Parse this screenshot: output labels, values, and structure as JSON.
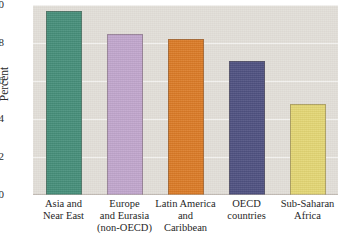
{
  "chart_data": {
    "type": "bar",
    "title": "",
    "xlabel": "",
    "ylabel": "Percent",
    "ylim": [
      0,
      10
    ],
    "yticks": [
      0,
      2,
      4,
      6,
      8,
      10
    ],
    "ytick_labels": [
      "0",
      "2",
      "4",
      "6",
      "8",
      "10"
    ],
    "grid": true,
    "legend": "none",
    "categories": [
      "Asia and Near East",
      "Europe and Eurasia (non-OECD)",
      "Latin America and Caribbean",
      "OECD countries",
      "Sub-Saharan Africa"
    ],
    "category_lines": [
      [
        "Asia and",
        "Near East"
      ],
      [
        "Europe",
        "and Eurasia",
        "(non-OECD)"
      ],
      [
        "Latin America",
        "and",
        "Caribbean"
      ],
      [
        "OECD",
        "countries"
      ],
      [
        "Sub-Saharan",
        "Africa"
      ]
    ],
    "values": [
      9.7,
      8.5,
      8.2,
      7.05,
      4.8
    ],
    "colors": [
      "#3e8a75",
      "#bfa3cc",
      "#d9761f",
      "#474a7c",
      "#e3d570"
    ]
  },
  "figure": {
    "background_color": "#e2ded8",
    "page_color": "#ffffff",
    "gridline_color": "#ffffff",
    "axis_text_color": "#2b2b2b",
    "top_text_fragment": ""
  }
}
